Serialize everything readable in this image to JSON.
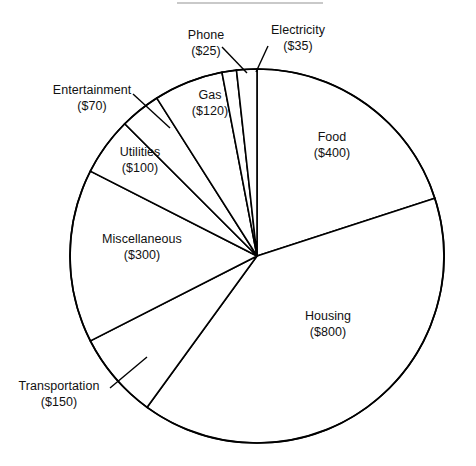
{
  "chart_data": {
    "type": "pie",
    "title": "",
    "subtitle": "",
    "xlabel": "",
    "ylabel": "",
    "legend": "none",
    "grid": false,
    "units": "USD",
    "total": 2000,
    "start_angle_deg": 0,
    "direction": "clockwise",
    "categories": [
      "Food",
      "Housing",
      "Transportation",
      "Miscellaneous",
      "Utilities",
      "Entertainment",
      "Gas",
      "Phone",
      "Electricity"
    ],
    "values": [
      400,
      800,
      150,
      300,
      100,
      70,
      120,
      25,
      35
    ],
    "slices": [
      {
        "label": "Food",
        "value": 400,
        "value_text": "($400)",
        "percent": 20,
        "angle_deg": 72
      },
      {
        "label": "Housing",
        "value": 800,
        "value_text": "($800)",
        "percent": 40,
        "angle_deg": 144
      },
      {
        "label": "Transportation",
        "value": 150,
        "value_text": "($150)",
        "percent": 7.5,
        "angle_deg": 27
      },
      {
        "label": "Miscellaneous",
        "value": 300,
        "value_text": "($300)",
        "percent": 15,
        "angle_deg": 54
      },
      {
        "label": "Utilities",
        "value": 100,
        "value_text": "($100)",
        "percent": 5,
        "angle_deg": 18
      },
      {
        "label": "Entertainment",
        "value": 70,
        "value_text": "($70)",
        "percent": 3.5,
        "angle_deg": 12.6
      },
      {
        "label": "Gas",
        "value": 120,
        "value_text": "($120)",
        "percent": 6,
        "angle_deg": 21.6
      },
      {
        "label": "Phone",
        "value": 25,
        "value_text": "($25)",
        "percent": 1.25,
        "angle_deg": 4.5
      },
      {
        "label": "Electricity",
        "value": 35,
        "value_text": "($35)",
        "percent": 1.75,
        "angle_deg": 6.3
      }
    ],
    "colors": {
      "slice_fill": "#ffffff",
      "slice_stroke": "#000000",
      "label_text": "#111111",
      "background": "#ffffff"
    }
  },
  "labels": {
    "food": {
      "name": "Food",
      "value": "($400)"
    },
    "housing": {
      "name": "Housing",
      "value": "($800)"
    },
    "transportation": {
      "name": "Transportation",
      "value": "($150)"
    },
    "miscellaneous": {
      "name": "Miscellaneous",
      "value": "($300)"
    },
    "utilities": {
      "name": "Utilities",
      "value": "($100)"
    },
    "entertainment": {
      "name": "Entertainment",
      "value": "($70)"
    },
    "gas": {
      "name": "Gas",
      "value": "($120)"
    },
    "phone": {
      "name": "Phone",
      "value": "($25)"
    },
    "electricity": {
      "name": "Electricity",
      "value": "($35)"
    }
  }
}
